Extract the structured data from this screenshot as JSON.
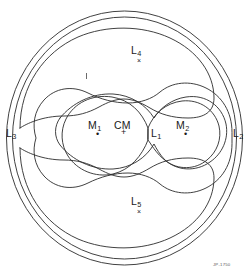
{
  "figure": {
    "type": "roche-equipotential-diagram",
    "background_color": "#ffffff",
    "stroke_color": "#2b2b2b"
  },
  "labels": {
    "m1": {
      "text": "M",
      "sub": "1",
      "x": 88,
      "y": 120,
      "marker": "dot",
      "marker_x": 96,
      "marker_y": 131
    },
    "m2": {
      "text": "M",
      "sub": "2",
      "x": 178,
      "y": 120,
      "marker": "dot",
      "marker_x": 185,
      "marker_y": 131
    },
    "cm": {
      "text": "CM",
      "sub": "",
      "x": 118,
      "y": 120,
      "marker": "plus",
      "marker_x": 124,
      "marker_y": 129
    },
    "l1": {
      "text": "L",
      "sub": "1",
      "x": 151,
      "y": 127,
      "marker": "none",
      "marker_x": 0,
      "marker_y": 0
    },
    "l2": {
      "text": "L",
      "sub": "2",
      "x": 232,
      "y": 127,
      "marker": "none",
      "marker_x": 0,
      "marker_y": 0
    },
    "l3": {
      "text": "L",
      "sub": "3",
      "x": 8,
      "y": 127,
      "marker": "none",
      "marker_x": 0,
      "marker_y": 0
    },
    "l4": {
      "text": "L",
      "sub": "4",
      "x": 131,
      "y": 46,
      "marker": "x",
      "marker_x": 137,
      "marker_y": 58
    },
    "l5": {
      "text": "L",
      "sub": "5",
      "x": 131,
      "y": 197,
      "marker": "x",
      "marker_x": 137,
      "marker_y": 209
    }
  },
  "markers": {
    "dot_glyph": "•",
    "plus_glyph": "+",
    "x_glyph": "×"
  },
  "credit": {
    "text": "JP-1750",
    "x": 213,
    "y": 263
  },
  "tick": {
    "x": 86,
    "y": 73,
    "height": 6
  },
  "legend_points": [
    {
      "name": "L1",
      "role": "inner-lagrange-point-between-masses"
    },
    {
      "name": "L2",
      "role": "outer-lagrange-point-beyond-M2"
    },
    {
      "name": "L3",
      "role": "outer-lagrange-point-beyond-M1"
    },
    {
      "name": "L4",
      "role": "leading-triangular-lagrange-point"
    },
    {
      "name": "L5",
      "role": "trailing-triangular-lagrange-point"
    }
  ]
}
